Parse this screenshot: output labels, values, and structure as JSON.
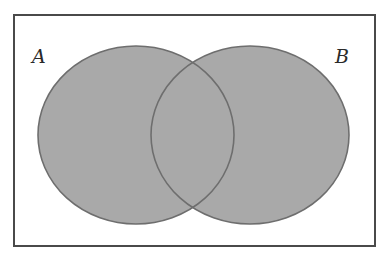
{
  "diagram": {
    "type": "venn",
    "universe": {
      "label": ""
    },
    "sets": [
      {
        "id": "A",
        "label": "A"
      },
      {
        "id": "B",
        "label": "B"
      }
    ],
    "shaded_regions": [
      "A only",
      "A ∩ B",
      "B only"
    ],
    "colors": {
      "fill": "#a9a9a9",
      "outline": "#6e6e6e",
      "frame": "#4a4a4a",
      "background": "#ffffff"
    }
  }
}
